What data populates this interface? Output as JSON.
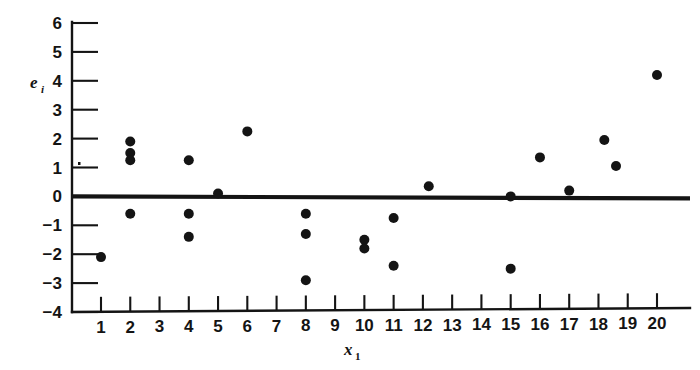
{
  "figure": {
    "background_color": "#ffffff",
    "ink_color": "#141414",
    "width": 700,
    "height": 370
  },
  "chart_data": {
    "type": "scatter",
    "title": "",
    "subtitle": "",
    "xlabel": "x_1",
    "xlabel_base": "x",
    "xlabel_sub": "1",
    "ylabel": "e_i",
    "ylabel_base": "e",
    "ylabel_sub": "i",
    "xlim": [
      0.3,
      21.0
    ],
    "ylim": [
      -4,
      6
    ],
    "grid": false,
    "legend": null,
    "x_ticks": [
      1,
      2,
      3,
      4,
      5,
      6,
      7,
      8,
      9,
      10,
      11,
      12,
      13,
      14,
      15,
      16,
      17,
      18,
      19,
      20
    ],
    "x_tick_labels": [
      "1",
      "2",
      "3",
      "4",
      "5",
      "6",
      "7",
      "8",
      "9",
      "10",
      "11",
      "12",
      "13",
      "14",
      "15",
      "16",
      "17",
      "18",
      "19",
      "20"
    ],
    "y_ticks": [
      -4,
      -3,
      -2,
      -1,
      0,
      1,
      2,
      3,
      4,
      5,
      6
    ],
    "y_tick_labels": [
      "-4",
      "-3",
      "-2",
      "-1",
      "0",
      "1",
      "2",
      "3",
      "4",
      "5",
      "6"
    ],
    "reference_line": {
      "name": "zero-residual-line",
      "y": 0,
      "orientation": "horizontal",
      "style": "solid-thick"
    },
    "point_radius": 5,
    "points": [
      {
        "x": 1.0,
        "y": -2.1
      },
      {
        "x": 2.0,
        "y": 1.9
      },
      {
        "x": 2.0,
        "y": 1.5
      },
      {
        "x": 2.0,
        "y": 1.25
      },
      {
        "x": 2.0,
        "y": -0.6
      },
      {
        "x": 4.0,
        "y": 1.25
      },
      {
        "x": 4.0,
        "y": -0.6
      },
      {
        "x": 4.0,
        "y": -1.4
      },
      {
        "x": 5.0,
        "y": 0.1
      },
      {
        "x": 6.0,
        "y": 2.25
      },
      {
        "x": 8.0,
        "y": -0.6
      },
      {
        "x": 8.0,
        "y": -1.3
      },
      {
        "x": 8.0,
        "y": -2.9
      },
      {
        "x": 10.0,
        "y": -1.5
      },
      {
        "x": 10.0,
        "y": -1.8
      },
      {
        "x": 11.0,
        "y": -0.75
      },
      {
        "x": 11.0,
        "y": -2.4
      },
      {
        "x": 12.2,
        "y": 0.35
      },
      {
        "x": 15.0,
        "y": 0.0
      },
      {
        "x": 15.0,
        "y": -2.5
      },
      {
        "x": 16.0,
        "y": 1.35
      },
      {
        "x": 17.0,
        "y": 0.2
      },
      {
        "x": 18.2,
        "y": 1.95
      },
      {
        "x": 18.6,
        "y": 1.05
      },
      {
        "x": 20.0,
        "y": 4.2
      }
    ]
  }
}
